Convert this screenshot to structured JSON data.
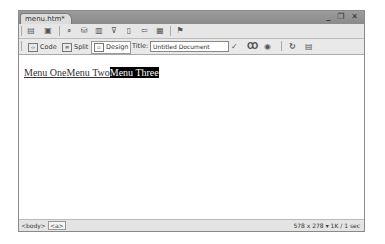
{
  "document_tab": {
    "label": "menu.htm*"
  },
  "window_controls": {
    "minimize": "_",
    "restore": "❐",
    "close": "✕"
  },
  "insert_toolbar": {
    "icons": [
      "common-icon",
      "layout-icon",
      "table-icon",
      "image-icon",
      "media-icon",
      "hyperlink-icon",
      "email-icon",
      "anchor-icon",
      "template-icon",
      "widget-icon"
    ]
  },
  "document_toolbar": {
    "view_buttons": [
      {
        "label": "Code",
        "active": false
      },
      {
        "label": "Split",
        "active": false
      },
      {
        "label": "Design",
        "active": true
      }
    ],
    "title_label": "Title:",
    "title_value": "Untitled Document",
    "right_icons": [
      "validate-icon",
      "browser-check-icon",
      "preview-icon",
      "refresh-icon",
      "view-options-icon"
    ]
  },
  "design_view": {
    "links": [
      {
        "text": "Menu One",
        "selected": false
      },
      {
        "text": "Menu Two",
        "selected": false
      },
      {
        "text": "Menu Three",
        "selected": true
      }
    ]
  },
  "status_bar": {
    "tags": [
      "<body>",
      "<a>"
    ],
    "window_size": "578 x 278",
    "download_info": "1K / 1 sec"
  }
}
